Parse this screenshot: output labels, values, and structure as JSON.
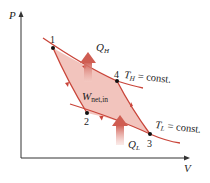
{
  "diagram": {
    "type": "P-V diagram (reversed Carnot cycle)",
    "axes": {
      "y_label": "P",
      "x_label": "V"
    },
    "points": [
      {
        "id": "1",
        "label": "1",
        "x": 53,
        "y": 48
      },
      {
        "id": "2",
        "label": "2",
        "x": 87,
        "y": 113
      },
      {
        "id": "3",
        "label": "3",
        "x": 150,
        "y": 134
      },
      {
        "id": "4",
        "label": "4",
        "x": 117,
        "y": 81
      }
    ],
    "isotherms": {
      "high": {
        "label_main": "T",
        "label_sub": "H",
        "label_rest": " = const."
      },
      "low": {
        "label_main": "T",
        "label_sub": "L",
        "label_rest": " = const."
      }
    },
    "heat": {
      "qh": {
        "main": "Q",
        "sub": "H"
      },
      "ql": {
        "main": "Q",
        "sub": "L"
      }
    },
    "work": {
      "main": "W",
      "sub": "net,in"
    },
    "colors": {
      "fill": "#f2c4bd",
      "curve": "#c9453a",
      "arrow": "#d9766c",
      "axis": "#333333"
    }
  }
}
